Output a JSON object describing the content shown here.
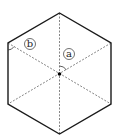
{
  "diagram": {
    "shape": "regular-hexagon",
    "center": {
      "x": 59.5,
      "y": 74
    },
    "vertices": [
      {
        "x": 59.5,
        "y": 13
      },
      {
        "x": 111,
        "y": 43
      },
      {
        "x": 111,
        "y": 104
      },
      {
        "x": 59.5,
        "y": 134
      },
      {
        "x": 8,
        "y": 104
      },
      {
        "x": 8,
        "y": 43
      }
    ],
    "dashed_diagonals": true,
    "labels": {
      "a": {
        "text": "a",
        "x": 69,
        "y": 54
      },
      "b": {
        "text": "b",
        "x": 30,
        "y": 44
      }
    },
    "colors": {
      "stroke": "#1a1a1a",
      "dashed": "#666666"
    }
  }
}
